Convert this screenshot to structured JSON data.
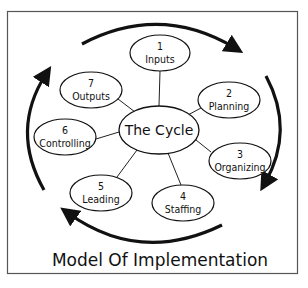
{
  "diagram": {
    "title": "Model Of Implementation",
    "center": {
      "label": "The Cycle"
    },
    "nodes": [
      {
        "number": "1",
        "label": "Inputs"
      },
      {
        "number": "2",
        "label": "Planning"
      },
      {
        "number": "3",
        "label": "Organizing"
      },
      {
        "number": "4",
        "label": "Staffing"
      },
      {
        "number": "5",
        "label": "Leading"
      },
      {
        "number": "6",
        "label": "Controlling"
      },
      {
        "number": "7",
        "label": "Outputs"
      }
    ],
    "colors": {
      "stroke": "#111111",
      "background": "#ffffff",
      "frame": "#555555"
    }
  }
}
